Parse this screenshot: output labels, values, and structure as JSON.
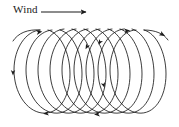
{
  "figure": {
    "title": "",
    "background_color": "#ffffff",
    "stroke_color": "#1a1a1a",
    "width": 179,
    "height": 127
  },
  "wind_annotation": {
    "label": "Wind",
    "arrow_direction": "right",
    "arrow_start_x": 41,
    "arrow_end_x": 88,
    "arrow_y": 12
  },
  "trajectory": {
    "description": "Overlapping looping cycloid path drifting to the right",
    "loop_count": 9,
    "loop_first_center_x": 42,
    "loop_last_center_x": 139,
    "loop_center_y": 70,
    "loop_radius_x": 29,
    "loop_radius_y": 41,
    "entry_point": "left",
    "exit_point": "upper-right",
    "direction_arrow_count": 7,
    "arrow_markers": [
      {
        "x": 40,
        "y": 31,
        "angle": -12
      },
      {
        "x": 128,
        "y": 30,
        "angle": -6
      },
      {
        "x": 166,
        "y": 33,
        "angle": 24
      },
      {
        "x": 17,
        "y": 73,
        "angle": 92
      },
      {
        "x": 92,
        "y": 49,
        "angle": 120
      },
      {
        "x": 105,
        "y": 44,
        "angle": 118
      },
      {
        "x": 107,
        "y": 86,
        "angle": 72
      },
      {
        "x": 45,
        "y": 117,
        "angle": 178
      },
      {
        "x": 96,
        "y": 118,
        "angle": 178
      }
    ]
  }
}
